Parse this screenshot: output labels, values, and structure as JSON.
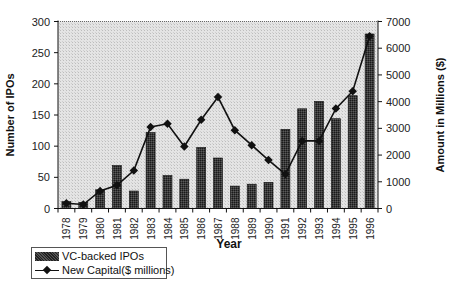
{
  "chart_data": {
    "type": "bar+line",
    "title": "",
    "xlabel": "Year",
    "ylabel": "Number of IPOs",
    "y2label": "Amount in Millions ($)",
    "categories": [
      "1978",
      "1979",
      "1980",
      "1981",
      "1982",
      "1983",
      "1984",
      "1985",
      "1986",
      "1987",
      "1988",
      "1989",
      "1990",
      "1991",
      "1992",
      "1993",
      "1994",
      "1995",
      "1996"
    ],
    "series": [
      {
        "name": "VC-backed IPOs",
        "type": "bar",
        "axis": "left",
        "values": [
          11,
          10,
          30,
          69,
          28,
          122,
          53,
          47,
          98,
          81,
          36,
          39,
          42,
          127,
          160,
          172,
          144,
          181,
          280
        ]
      },
      {
        "name": "New Capital($ millions)",
        "type": "line",
        "axis": "right",
        "values": [
          200,
          150,
          660,
          870,
          1420,
          3050,
          3170,
          2320,
          3320,
          4170,
          2930,
          2370,
          1810,
          1280,
          2530,
          2530,
          3740,
          4390,
          6450
        ]
      }
    ],
    "ylim": [
      0,
      300
    ],
    "y2lim": [
      0,
      7000
    ],
    "yticks": [
      "0",
      "50",
      "100",
      "150",
      "200",
      "250",
      "300"
    ],
    "y2ticks": [
      "0",
      "1000",
      "2000",
      "3000",
      "4000",
      "5000",
      "6000",
      "7000"
    ],
    "grid": false,
    "legend_position": "bottom-left"
  },
  "legend": {
    "bar_label": "VC-backed IPOs",
    "line_label": "New Capital($ millions)"
  }
}
